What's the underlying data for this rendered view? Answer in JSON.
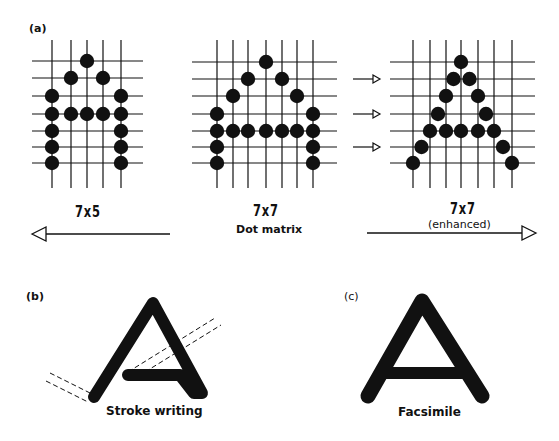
{
  "panels": {
    "a": {
      "tag": "(a)",
      "grids": [
        {
          "name": "7x5",
          "label": "7x5",
          "cols": [
            52,
            71,
            87,
            103,
            121
          ],
          "rows": [
            61,
            78,
            96,
            114,
            131,
            147,
            163
          ],
          "h_extent": [
            32,
            143
          ],
          "v_extent": [
            40,
            188
          ],
          "dots": [
            [
              2,
              0
            ],
            [
              1,
              1
            ],
            [
              3,
              1
            ],
            [
              0,
              2
            ],
            [
              4,
              2
            ],
            [
              0,
              3
            ],
            [
              1,
              3
            ],
            [
              2,
              3
            ],
            [
              3,
              3
            ],
            [
              4,
              3
            ],
            [
              0,
              4
            ],
            [
              4,
              4
            ],
            [
              0,
              5
            ],
            [
              4,
              5
            ],
            [
              0,
              6
            ],
            [
              4,
              6
            ]
          ]
        },
        {
          "name": "7x7",
          "label": "7x7",
          "sublabel": "Dot matrix",
          "cols": [
            217,
            233,
            248,
            266,
            282,
            297,
            313
          ],
          "rows": [
            62,
            79,
            96,
            114,
            131,
            147,
            163
          ],
          "h_extent": [
            192,
            337
          ],
          "v_extent": [
            40,
            188
          ],
          "dots": [
            [
              3,
              0
            ],
            [
              2,
              1
            ],
            [
              4,
              1
            ],
            [
              1,
              2
            ],
            [
              5,
              2
            ],
            [
              0,
              3
            ],
            [
              6,
              3
            ],
            [
              0,
              4
            ],
            [
              1,
              4
            ],
            [
              2,
              4
            ],
            [
              3,
              4
            ],
            [
              4,
              4
            ],
            [
              5,
              4
            ],
            [
              6,
              4
            ],
            [
              0,
              5
            ],
            [
              6,
              5
            ],
            [
              0,
              6
            ],
            [
              6,
              6
            ]
          ]
        },
        {
          "name": "7x7-enhanced",
          "label": "7x7",
          "sublabel": "(enhanced)",
          "cols": [
            413,
            430,
            446,
            461,
            478,
            494,
            512
          ],
          "rows": [
            62,
            79,
            96,
            114,
            131,
            147,
            163
          ],
          "h_extent": [
            390,
            535
          ],
          "v_extent": [
            40,
            188
          ],
          "dots": [
            [
              3,
              0
            ],
            [
              2.5,
              1
            ],
            [
              3.5,
              1
            ],
            [
              2,
              2
            ],
            [
              4,
              2
            ],
            [
              1.5,
              3
            ],
            [
              4.5,
              3
            ],
            [
              1,
              4
            ],
            [
              2,
              4
            ],
            [
              3,
              4
            ],
            [
              4,
              4
            ],
            [
              5,
              4
            ],
            [
              0.5,
              5
            ],
            [
              5.5,
              5
            ],
            [
              0,
              6
            ],
            [
              6,
              6
            ]
          ]
        }
      ],
      "shift_arrows_rows": [
        1,
        3,
        5
      ],
      "arrow_left_label": "7x5",
      "arrow_right_label": "7x7"
    },
    "b": {
      "tag": "(b)",
      "caption": "Stroke writing"
    },
    "c": {
      "tag": "(c)",
      "caption": "Facsimile"
    }
  },
  "colors": {
    "ink": "#111111",
    "background": "#ffffff"
  }
}
